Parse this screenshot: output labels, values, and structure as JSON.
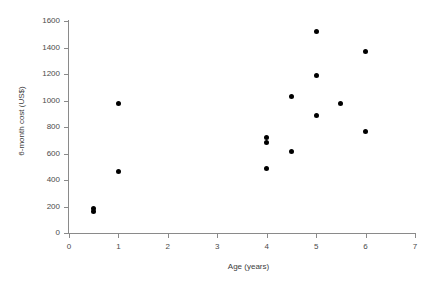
{
  "chart_data": {
    "type": "scatter",
    "title": "",
    "xlabel": "Age (years)",
    "ylabel": "6-month cost (US$)",
    "xlim": [
      0,
      7
    ],
    "ylim": [
      0,
      1600
    ],
    "xticks": [
      0,
      1,
      2,
      3,
      4,
      5,
      6,
      7
    ],
    "yticks": [
      0,
      200,
      400,
      600,
      800,
      1000,
      1200,
      1400,
      1600
    ],
    "xtick_labels": [
      "0",
      "1",
      "2",
      "3",
      "4",
      "5",
      "6",
      "7"
    ],
    "ytick_labels": [
      "0",
      "200",
      "400",
      "600",
      "800",
      "1000",
      "1200",
      "1400",
      "1600"
    ],
    "grid": false,
    "legend": null,
    "marker": "filled-circle",
    "marker_color": "#000000",
    "axis_color": "#8a8a8a",
    "points": [
      {
        "x": 0.5,
        "y": 185
      },
      {
        "x": 0.5,
        "y": 160
      },
      {
        "x": 1.0,
        "y": 975
      },
      {
        "x": 1.0,
        "y": 465
      },
      {
        "x": 4.0,
        "y": 720
      },
      {
        "x": 4.0,
        "y": 685
      },
      {
        "x": 4.0,
        "y": 490
      },
      {
        "x": 4.5,
        "y": 1030
      },
      {
        "x": 4.5,
        "y": 615
      },
      {
        "x": 5.0,
        "y": 1520
      },
      {
        "x": 5.0,
        "y": 1190
      },
      {
        "x": 5.0,
        "y": 885
      },
      {
        "x": 5.5,
        "y": 980
      },
      {
        "x": 6.0,
        "y": 1370
      },
      {
        "x": 6.0,
        "y": 765
      }
    ]
  }
}
